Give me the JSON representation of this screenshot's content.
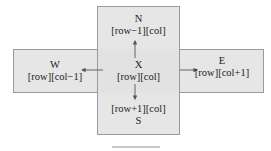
{
  "diagram": {
    "type": "grid-neighbors",
    "center": {
      "label": "X",
      "index": "[row][col]"
    },
    "north": {
      "label": "N",
      "index": "[row−1][col]"
    },
    "south": {
      "label": "S",
      "index": "[row+1][col]"
    },
    "west": {
      "label": "W",
      "index": "[row][col−1]"
    },
    "east": {
      "label": "E",
      "index": "[row][col+1]"
    },
    "colors": {
      "box_fill": "#e6e6e6",
      "box_border": "#9a9a9a",
      "arrow": "#555555"
    }
  },
  "caption": {
    "text": ""
  }
}
